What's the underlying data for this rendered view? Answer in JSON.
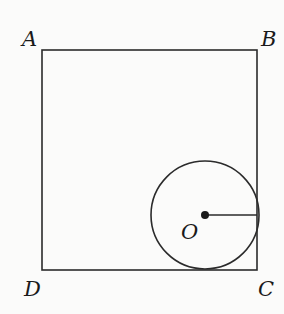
{
  "diagram": {
    "vertices": {
      "A": {
        "label": "A",
        "x": 42,
        "y": 50
      },
      "B": {
        "label": "B",
        "x": 257,
        "y": 50
      },
      "C": {
        "label": "C",
        "x": 257,
        "y": 270
      },
      "D": {
        "label": "D",
        "x": 42,
        "y": 270
      }
    },
    "circle": {
      "center_label": "O",
      "cx": 205,
      "cy": 215,
      "r": 54
    },
    "radius_segment": {
      "from": "O",
      "to_side": "BC"
    },
    "colors": {
      "stroke": "#2b2b2b",
      "background": "#fbfbfa"
    }
  }
}
